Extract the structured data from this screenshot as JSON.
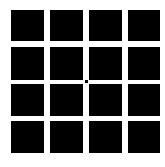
{
  "figure": {
    "background_color": "#ffffff",
    "square_color": "#000000",
    "rows": 4,
    "columns": 4,
    "column_x": [
      11,
      50,
      89,
      128
    ],
    "column_w": [
      33,
      33,
      33,
      32
    ],
    "row_y": [
      10,
      47,
      84,
      121
    ],
    "row_h": [
      31,
      33,
      32,
      32
    ],
    "fixation_dot": {
      "x": 85,
      "y": 80
    }
  }
}
